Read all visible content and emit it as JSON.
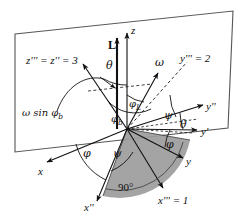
{
  "figure": {
    "type": "euler-angle-vector-diagram",
    "background_color": "#ffffff",
    "line_color": "#1a1a1a",
    "shaded_sector_color": "#9a9a9a",
    "plane": {
      "name": "reference-plane",
      "stroke": "#555555"
    },
    "labels": {
      "z_triple_prime": "z''' = z'' = 3",
      "y_triple_prime": "y''' = 2",
      "x_triple_prime": "x''' = 1",
      "x_double_prime": "x''",
      "y_double_prime": "y''",
      "y_prime": "y'",
      "y_axis": "y",
      "x_axis": "x",
      "z_axis": "z",
      "angular_momentum": "L",
      "omega_vector": "ω",
      "omega_sin_phi_b": "ω sin φ",
      "omega_sin_phi_b_sub": "b",
      "theta_top": "θ",
      "theta_right": "θ",
      "phi_L": "φ",
      "phi_L_sub": "L",
      "phi_b": "φ",
      "phi_b_sub": "b",
      "psi_upper": "ψ",
      "psi_lower": "ψ",
      "phi_left": "φ",
      "phi_right": "φ",
      "right_angle": "90°"
    },
    "axis_numbers": {
      "axis_3": "3",
      "axis_2": "2",
      "axis_1": "1"
    }
  }
}
